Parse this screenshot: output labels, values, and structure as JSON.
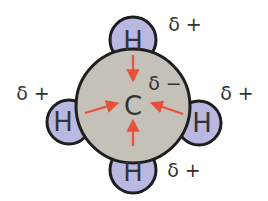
{
  "diagram": {
    "central_atom": {
      "symbol": "C",
      "charge_label": "δ −"
    },
    "hydrogens": [
      {
        "position": "top",
        "symbol": "H",
        "charge_label": "δ +"
      },
      {
        "position": "left",
        "symbol": "H",
        "charge_label": "δ +"
      },
      {
        "position": "right",
        "symbol": "H",
        "charge_label": "δ +"
      },
      {
        "position": "bottom",
        "symbol": "H",
        "charge_label": "δ +"
      }
    ],
    "colors": {
      "carbon_fill": "#c5c1b8",
      "hydrogen_fill": "#b9b8e0",
      "outline": "#1e1e1e",
      "arrow": "#e8503a",
      "text": "#333333"
    }
  }
}
